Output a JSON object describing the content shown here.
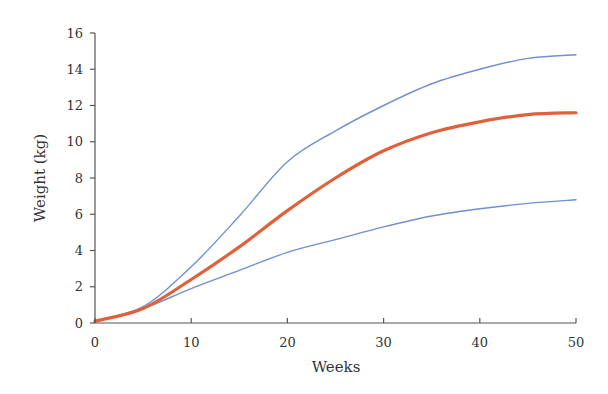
{
  "chart_data": {
    "type": "line",
    "title": "",
    "xlabel": "Weeks",
    "ylabel": "Weight (kg)",
    "xlim": [
      0,
      50
    ],
    "ylim": [
      0,
      16
    ],
    "x_ticks": [
      0,
      10,
      20,
      30,
      40,
      50
    ],
    "y_ticks": [
      0,
      2,
      4,
      6,
      8,
      10,
      12,
      14,
      16
    ],
    "grid": false,
    "legend": null,
    "x": [
      0,
      5,
      10,
      15,
      20,
      25,
      30,
      35,
      40,
      45,
      50
    ],
    "series": [
      {
        "name": "Upper bound",
        "color": "#7090d0",
        "width": 1.4,
        "values": [
          0.1,
          0.9,
          3.1,
          5.9,
          8.9,
          10.6,
          12.0,
          13.2,
          14.0,
          14.6,
          14.8
        ]
      },
      {
        "name": "Median",
        "color": "#e0603a",
        "width": 3.2,
        "values": [
          0.1,
          0.8,
          2.4,
          4.2,
          6.2,
          8.0,
          9.5,
          10.5,
          11.1,
          11.5,
          11.6
        ]
      },
      {
        "name": "Lower bound",
        "color": "#7090d0",
        "width": 1.4,
        "values": [
          0.1,
          0.8,
          1.9,
          2.9,
          3.9,
          4.6,
          5.3,
          5.9,
          6.3,
          6.6,
          6.8
        ]
      }
    ]
  },
  "labels": {
    "xlabel": "Weeks",
    "ylabel": "Weight (kg)"
  }
}
